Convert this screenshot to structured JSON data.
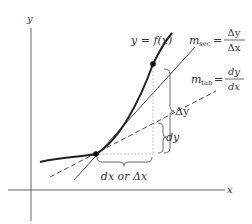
{
  "diagram": {
    "axes": {
      "x_label": "x",
      "y_label": "y"
    },
    "curve_label": "y = f(x)",
    "secant": {
      "label_m": "m",
      "label_sub": "sec",
      "eq": "=",
      "num": "Δy",
      "den": "Δx"
    },
    "tangent": {
      "label_m": "m",
      "label_sub": "tan",
      "eq": "=",
      "num": "dy",
      "den": "dx"
    },
    "braces": {
      "delta_y": "Δy",
      "dy": "dy",
      "dx": "dx or Δx"
    },
    "colors": {
      "curve": "#222222",
      "lines": "#444444",
      "dotted": "#999999",
      "brace": "#666666"
    }
  }
}
